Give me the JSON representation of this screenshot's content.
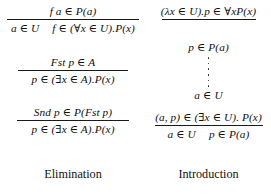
{
  "figure": {
    "type": "inference-rules",
    "columns": {
      "left": {
        "caption": "Elimination",
        "rules": [
          {
            "name": "forall-elimination",
            "premise": "f a ∈ P(a)",
            "conclusion_parts": [
              "a ∈ U",
              "f ∈ (∀x ∈ U).P(x)"
            ],
            "conclusion": "a ∈ U   f ∈ (∀x ∈ U).P(x)"
          },
          {
            "name": "exists-elimination-fst",
            "premise": "Fst p ∈ A",
            "conclusion": "p ∈ (∃x ∈ A).P(x)"
          },
          {
            "name": "exists-elimination-snd",
            "premise": "Snd p ∈ P(Fst p)",
            "conclusion": "p ∈ (∃x ∈ A).P(x)"
          }
        ]
      },
      "right": {
        "caption": "Introduction",
        "rules": [
          {
            "name": "forall-introduction",
            "premise": "(λx ∈ U).p ∈ ∀xP(x)",
            "conclusion": "p ∈ P(a)"
          },
          {
            "name": "derivation-ellipsis",
            "dots": 6,
            "below": "a ∈ U"
          },
          {
            "name": "exists-introduction",
            "premise": "(a, p) ∈ (∃x ∈ U). P(x)",
            "conclusion_parts": [
              "a ∈ U",
              "p ∈ P(a)"
            ],
            "conclusion": "a ∈ U   p ∈ P(a)"
          }
        ]
      }
    },
    "colors": {
      "background": "#ffffff",
      "text": "#111111",
      "rule_bar": "#1a1a1a"
    }
  }
}
